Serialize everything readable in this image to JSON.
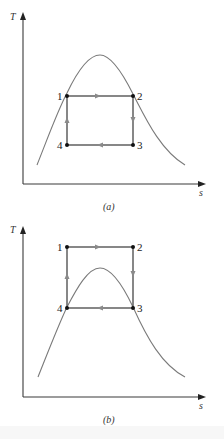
{
  "figure": {
    "colors": {
      "axis": "#3a3a3a",
      "dome_curve": "#7a7a7a",
      "cycle_lines": "#555555",
      "flow_arrows": "#8a8a8a",
      "state_points": "#111111"
    },
    "panels": [
      {
        "id": "a",
        "caption": "(a)",
        "y_axis_label": "T",
        "x_axis_label": "s",
        "state_labels": [
          "1",
          "2",
          "3",
          "4"
        ],
        "note": "Cycle lies entirely inside the vapor dome; states 1 and 2 on the saturation curve"
      },
      {
        "id": "b",
        "caption": "(b)",
        "y_axis_label": "T",
        "x_axis_label": "s",
        "state_labels": [
          "1",
          "2",
          "3",
          "4"
        ],
        "note": "Cycle lies above the dome; states 4 and 3 on the saturation curve"
      }
    ]
  }
}
